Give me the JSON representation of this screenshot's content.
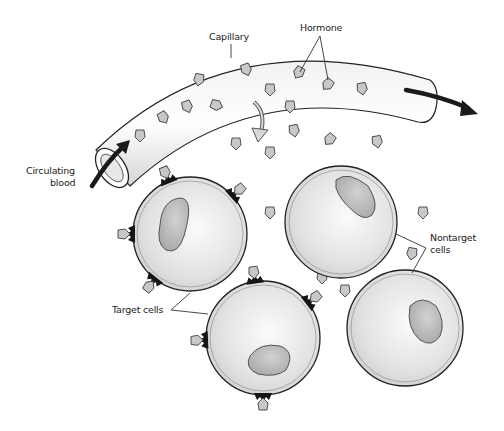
{
  "diagram": {
    "labels": {
      "capillary": "Capillary",
      "hormone": "Hormone",
      "circulating_blood_line1": "Circulating",
      "circulating_blood_line2": "blood",
      "target_cells": "Target cells",
      "nontarget_cells_line1": "Nontarget",
      "nontarget_cells_line2": "cells"
    },
    "nodes": [
      {
        "id": "capillary",
        "type": "vessel",
        "label": "Capillary"
      },
      {
        "id": "blood-flow",
        "type": "flow",
        "label": "Circulating blood"
      },
      {
        "id": "hormone",
        "type": "molecule",
        "label": "Hormone"
      },
      {
        "id": "target-cell-1",
        "type": "cell",
        "category": "target",
        "has_receptors": true
      },
      {
        "id": "target-cell-2",
        "type": "cell",
        "category": "target",
        "has_receptors": true
      },
      {
        "id": "nontarget-cell-1",
        "type": "cell",
        "category": "nontarget",
        "has_receptors": false
      },
      {
        "id": "nontarget-cell-2",
        "type": "cell",
        "category": "nontarget",
        "has_receptors": false
      }
    ],
    "edges": [
      {
        "from": "blood-flow",
        "to": "capillary",
        "relation": "flows through"
      },
      {
        "from": "hormone",
        "to": "target-cell-1",
        "relation": "binds receptor"
      },
      {
        "from": "hormone",
        "to": "target-cell-2",
        "relation": "binds receptor"
      },
      {
        "from": "capillary",
        "to": "hormone",
        "relation": "hormone exits capillary"
      }
    ],
    "colors": {
      "cell_fill": "#e4e4e4",
      "nucleus_fill": "#b5b5b5",
      "hormone_fill": "#c8c8c8",
      "receptor": "#151515",
      "outline": "#222222"
    }
  }
}
